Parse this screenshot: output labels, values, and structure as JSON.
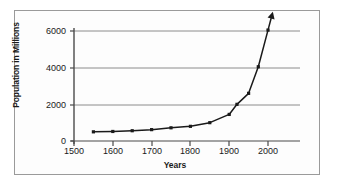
{
  "figure": {
    "background_color": "#ffffff",
    "frame_color": "#9a9a9a",
    "line_color": "#1a1a1a",
    "grid_color": "#8c8c8c"
  },
  "chart_data": {
    "type": "line",
    "title": "",
    "xlabel": "Years",
    "ylabel": "Population in Millions",
    "xlim": [
      1500,
      2025
    ],
    "ylim": [
      0,
      6800
    ],
    "xticks": [
      1500,
      1600,
      1700,
      1800,
      1900,
      2000
    ],
    "xtick_labels": [
      "1500",
      "1600",
      "1700",
      "1800",
      "1900",
      "2000"
    ],
    "yticks": [
      0,
      2000,
      4000,
      6000
    ],
    "ytick_labels": [
      "0",
      "2000",
      "4000",
      "6000"
    ],
    "grid": "horizontal",
    "legend": "none",
    "markers": "filled-square",
    "arrow_head": "end-of-line-up-right",
    "x": [
      1550,
      1600,
      1650,
      1700,
      1750,
      1800,
      1850,
      1900,
      1920,
      1950,
      1975,
      2000
    ],
    "values": [
      500,
      520,
      560,
      620,
      720,
      800,
      1000,
      1450,
      2000,
      2600,
      4050,
      6050
    ],
    "series": [
      {
        "name": "World population",
        "x": [
          1550,
          1600,
          1650,
          1700,
          1750,
          1800,
          1850,
          1900,
          1920,
          1950,
          1975,
          2000
        ],
        "values": [
          500,
          520,
          560,
          620,
          720,
          800,
          1000,
          1450,
          2000,
          2600,
          4050,
          6050
        ]
      }
    ]
  }
}
